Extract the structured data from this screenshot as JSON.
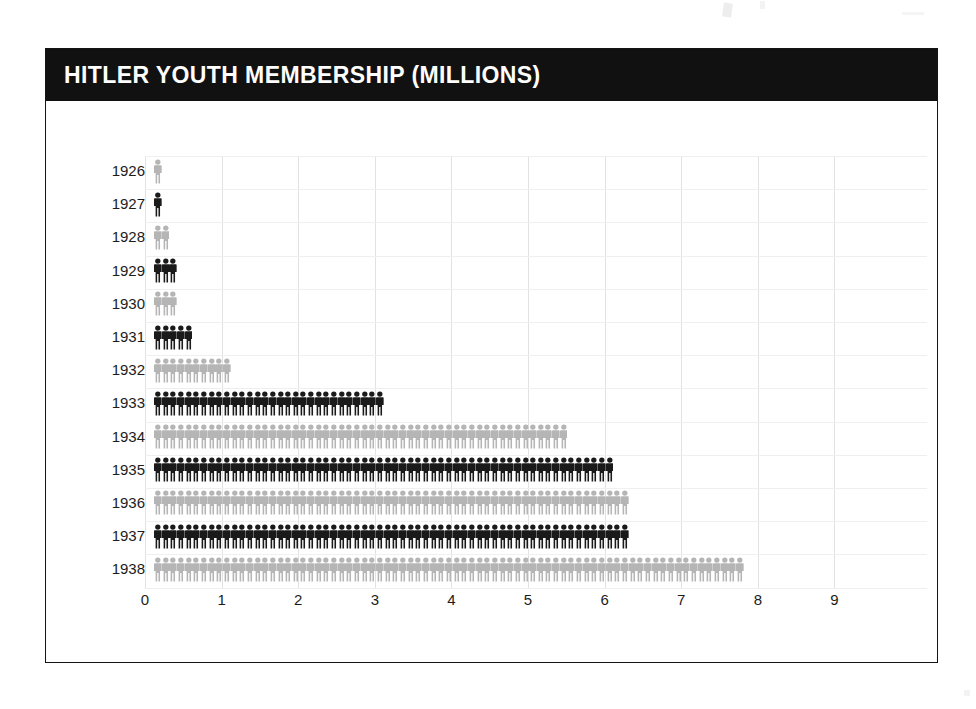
{
  "card": {
    "title": "HITLER YOUTH MEMBERSHIP (MILLIONS)"
  },
  "colors": {
    "header_background": "#111111",
    "header_text": "#ffffff",
    "series_dark": "#1a1a1a",
    "series_light": "#b5b5b5",
    "gridline": "#e2e2e2",
    "page_background": "#ffffff",
    "border": "#141414"
  },
  "chart_data": {
    "type": "bar",
    "subtype": "pictogram",
    "title": "HITLER YOUTH MEMBERSHIP (MILLIONS)",
    "orientation": "horizontal",
    "xlabel": "",
    "ylabel": "",
    "xlim": [
      0,
      9
    ],
    "xticks": [
      "0",
      "1",
      "2",
      "3",
      "4",
      "5",
      "6",
      "7",
      "8",
      "9"
    ],
    "grid": true,
    "legend": "none",
    "unit": "millions",
    "units_per_icon": 0.1,
    "icon": "person-pictogram",
    "categories": [
      "1926",
      "1927",
      "1928",
      "1929",
      "1930",
      "1931",
      "1932",
      "1933",
      "1934",
      "1935",
      "1936",
      "1937",
      "1938"
    ],
    "values": [
      0.1,
      0.1,
      0.2,
      0.3,
      0.3,
      0.5,
      1.0,
      3.0,
      5.4,
      6.0,
      6.2,
      6.2,
      7.7
    ],
    "icon_counts": [
      1,
      1,
      2,
      3,
      3,
      5,
      10,
      30,
      54,
      60,
      62,
      62,
      77
    ],
    "icon_colors": [
      "light",
      "dark",
      "light",
      "dark",
      "light",
      "dark",
      "light",
      "dark",
      "light",
      "dark",
      "light",
      "dark",
      "light"
    ],
    "rows": [
      {
        "label": "1926",
        "value": 0.1,
        "icons": 1,
        "shade": "light"
      },
      {
        "label": "1927",
        "value": 0.1,
        "icons": 1,
        "shade": "dark"
      },
      {
        "label": "1928",
        "value": 0.2,
        "icons": 2,
        "shade": "light"
      },
      {
        "label": "1929",
        "value": 0.3,
        "icons": 3,
        "shade": "dark"
      },
      {
        "label": "1930",
        "value": 0.3,
        "icons": 3,
        "shade": "light"
      },
      {
        "label": "1931",
        "value": 0.5,
        "icons": 5,
        "shade": "dark"
      },
      {
        "label": "1932",
        "value": 1.0,
        "icons": 10,
        "shade": "light"
      },
      {
        "label": "1933",
        "value": 3.0,
        "icons": 30,
        "shade": "dark"
      },
      {
        "label": "1934",
        "value": 5.4,
        "icons": 54,
        "shade": "light"
      },
      {
        "label": "1935",
        "value": 6.0,
        "icons": 60,
        "shade": "dark"
      },
      {
        "label": "1936",
        "value": 6.2,
        "icons": 62,
        "shade": "light"
      },
      {
        "label": "1937",
        "value": 6.2,
        "icons": 62,
        "shade": "dark"
      },
      {
        "label": "1938",
        "value": 7.7,
        "icons": 77,
        "shade": "light"
      }
    ]
  }
}
